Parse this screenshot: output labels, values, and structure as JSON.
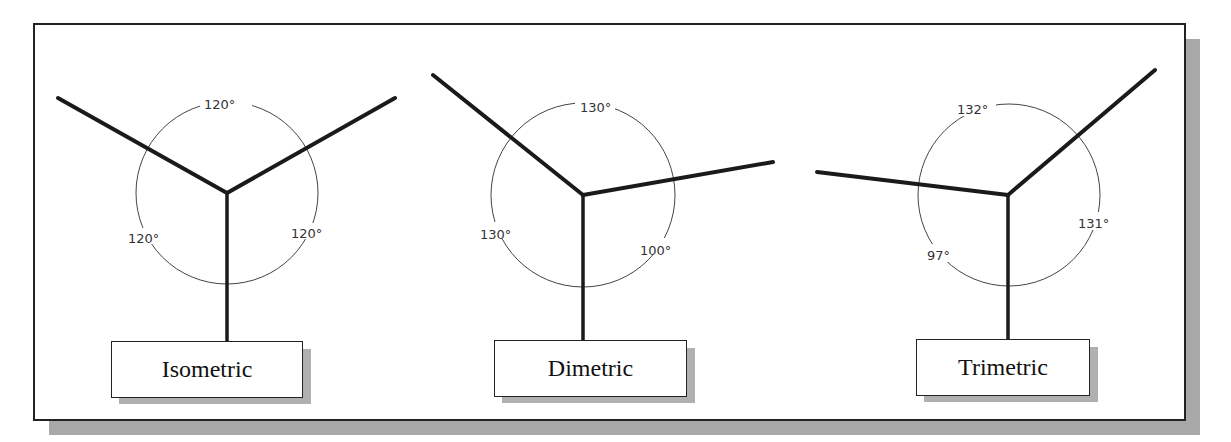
{
  "diagram": {
    "panels": [
      {
        "name": "Isometric",
        "label": "Isometric",
        "angles": {
          "top": "120°",
          "left": "120°",
          "right": "120°"
        }
      },
      {
        "name": "Dimetric",
        "label": "Dimetric",
        "angles": {
          "top": "130°",
          "left": "130°",
          "right": "100°"
        }
      },
      {
        "name": "Trimetric",
        "label": "Trimetric",
        "angles": {
          "top": "132°",
          "left": "97°",
          "right": "131°"
        }
      }
    ],
    "colors": {
      "line": "#1a1a1a",
      "arc": "#444444",
      "shadow": "#a8a8a8",
      "background": "#ffffff"
    }
  }
}
